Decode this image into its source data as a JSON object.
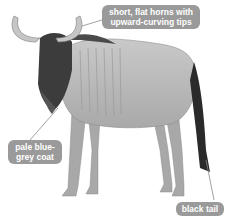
{
  "colors": {
    "label_bg": "#9a9a9a",
    "label_text": "#ffffff",
    "leader_line": "#8a8a8a"
  },
  "labels": [
    {
      "id": "horns",
      "text": "short, flat horns with upward-curving tips"
    },
    {
      "id": "coat",
      "text": "pale blue-grey coat"
    },
    {
      "id": "tail",
      "text": "black tail"
    }
  ]
}
